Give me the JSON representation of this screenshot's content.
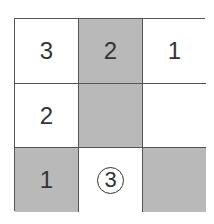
{
  "puzzle": {
    "rows": 3,
    "cols": 3,
    "cells": [
      {
        "row": 1,
        "col": 1,
        "value": "3",
        "shaded": false,
        "circled": false
      },
      {
        "row": 1,
        "col": 2,
        "value": "2",
        "shaded": true,
        "circled": false
      },
      {
        "row": 1,
        "col": 3,
        "value": "1",
        "shaded": false,
        "circled": false
      },
      {
        "row": 2,
        "col": 1,
        "value": "2",
        "shaded": false,
        "circled": false
      },
      {
        "row": 2,
        "col": 2,
        "value": "",
        "shaded": true,
        "circled": false
      },
      {
        "row": 2,
        "col": 3,
        "value": "",
        "shaded": false,
        "circled": false
      },
      {
        "row": 3,
        "col": 1,
        "value": "1",
        "shaded": true,
        "circled": false
      },
      {
        "row": 3,
        "col": 2,
        "value": "3",
        "shaded": false,
        "circled": true
      },
      {
        "row": 3,
        "col": 3,
        "value": "",
        "shaded": true,
        "circled": false
      }
    ],
    "colors": {
      "shaded": "#b9b9b9",
      "line": "#555555",
      "text": "#333333"
    }
  }
}
